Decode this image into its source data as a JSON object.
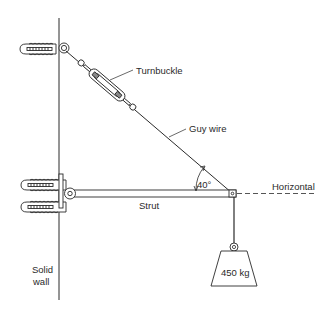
{
  "diagram": {
    "labels": {
      "turnbuckle": "Turnbuckle",
      "guy_wire": "Guy wire",
      "angle": "40°",
      "horizontal": "Horizontal",
      "strut": "Strut",
      "weight": "450 kg",
      "wall_line1": "Solid",
      "wall_line2": "wall"
    },
    "angle_degrees": 40,
    "mass_kg": 450,
    "colors": {
      "line": "#2a2a2a",
      "background": "#ffffff"
    }
  }
}
